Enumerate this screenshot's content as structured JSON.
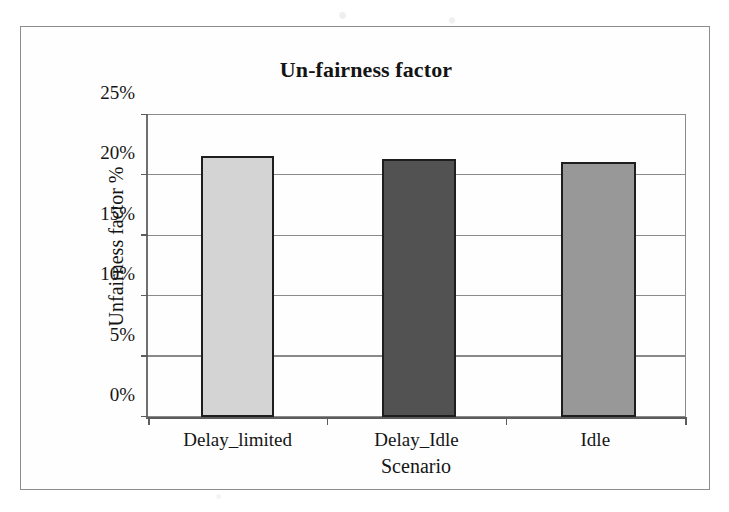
{
  "chart_data": {
    "type": "bar",
    "title": "Un-fairness factor",
    "xlabel": "Scenario",
    "ylabel": "Unfairness factor %",
    "categories": [
      "Delay_limited",
      "Delay_Idle",
      "Idle"
    ],
    "values": [
      21.6,
      21.4,
      21.1
    ],
    "value_unit": "%",
    "ylim": [
      0,
      25
    ],
    "ytick_values": [
      0,
      5,
      10,
      15,
      20,
      25
    ],
    "ytick_labels": [
      "0%",
      "5%",
      "10%",
      "15%",
      "20%",
      "25%"
    ],
    "grid": true,
    "legend": false,
    "series": [
      {
        "name": "Unfairness factor",
        "points": [
          {
            "category": "Delay_limited",
            "value": 21.6,
            "color": "#d4d4d4"
          },
          {
            "category": "Delay_Idle",
            "value": 21.4,
            "color": "#525252"
          },
          {
            "category": "Idle",
            "value": 21.1,
            "color": "#989898"
          }
        ]
      }
    ],
    "colors": {
      "bar_delay_limited": "#d4d4d4",
      "bar_delay_idle": "#525252",
      "bar_idle": "#989898",
      "bar_outline": "#1e1e1e",
      "gridline": "#8a8a8a",
      "axis": "#5c5c5c",
      "frame": "#8d8d8d",
      "text": "#151515",
      "plot_background": "#fefefe"
    }
  }
}
